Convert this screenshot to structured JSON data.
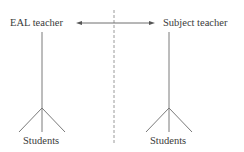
{
  "diagram": {
    "left_node": {
      "label": "EAL teacher",
      "sub_label": "Students"
    },
    "right_node": {
      "label": "Subject teacher",
      "sub_label": "Students"
    },
    "connector": {
      "type": "double-headed-arrow"
    },
    "divider": {
      "type": "dashed-vertical-line"
    }
  },
  "colors": {
    "line": "#6e6e6e",
    "text": "#3a3a3a",
    "divider": "#9a9a9a"
  }
}
